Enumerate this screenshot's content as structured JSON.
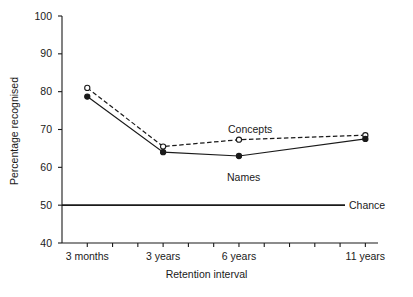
{
  "figure": {
    "background_color": "#ffffff",
    "line_color": "#1a1a1a",
    "text_color": "#1a1a1a"
  },
  "chart_data": {
    "type": "line",
    "title": "",
    "subtitle": "",
    "xlabel": "Retention interval",
    "ylabel": "Percentage recognised",
    "categories": [
      "3 months",
      "3 years",
      "6 years",
      "11 years"
    ],
    "category_positions": [
      1,
      4,
      7,
      12
    ],
    "tick_count": 12,
    "ylim": [
      40,
      100
    ],
    "yticks": [
      40,
      50,
      60,
      70,
      80,
      90,
      100
    ],
    "ytick_labels": [
      "40",
      "50",
      "60",
      "70",
      "80",
      "90",
      "100"
    ],
    "grid": false,
    "legend": "inline-annotations",
    "series": [
      {
        "name": "Concepts",
        "values": [
          81.0,
          65.5,
          67.3,
          68.5
        ],
        "linestyle": "dashed",
        "marker": "open-circle",
        "color": "#1a1a1a"
      },
      {
        "name": "Names",
        "values": [
          78.7,
          64.0,
          63.0,
          67.5
        ],
        "linestyle": "solid",
        "marker": "filled-circle",
        "color": "#1a1a1a"
      }
    ],
    "reference_lines": [
      {
        "name": "Chance",
        "value": 50,
        "orientation": "horizontal",
        "linestyle": "solid",
        "color": "#1a1a1a"
      }
    ],
    "annotations": [
      {
        "text": "Concepts",
        "x_px": 228,
        "y_px": 124
      },
      {
        "text": "Names",
        "x_px": 227,
        "y_px": 172
      },
      {
        "text": "Chance",
        "x_px": 349,
        "y_px": 200
      }
    ]
  }
}
